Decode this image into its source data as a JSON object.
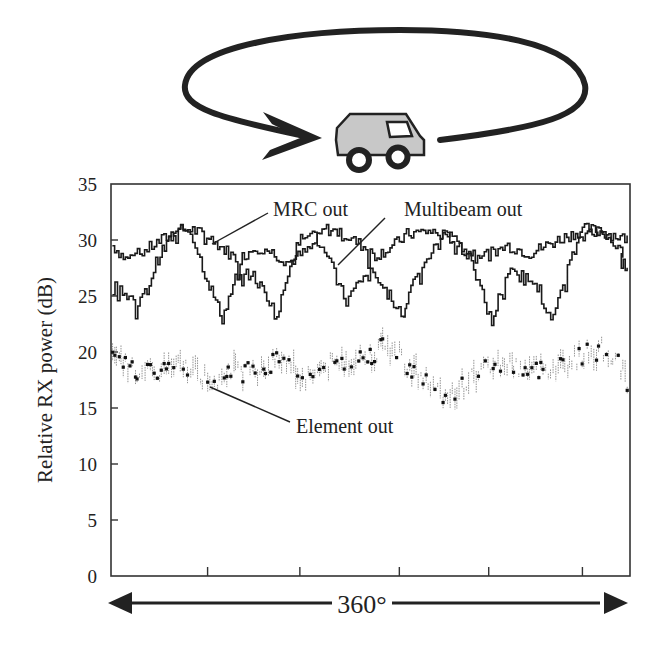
{
  "chart_data": {
    "type": "line",
    "title": "",
    "xlabel": "360°",
    "ylabel": "Relative RX power (dB)",
    "xlim": [
      0,
      360
    ],
    "ylim": [
      0,
      35
    ],
    "yticks": [
      0,
      5,
      10,
      15,
      20,
      25,
      30,
      35
    ],
    "ytick_labels": [
      "0",
      "5",
      "10",
      "15",
      "20",
      "25",
      "30",
      "35"
    ],
    "xticks": [
      67,
      131,
      200,
      262,
      327
    ],
    "xtick_labels": [
      "",
      "",
      "",
      "",
      ""
    ],
    "grid": false,
    "legend": "inline annotations",
    "illustration": "car-circling-arrow",
    "series": [
      {
        "name": "MRC out",
        "style": "staircase-solid",
        "x": [
          1,
          10,
          20,
          30,
          45,
          55,
          68,
          80,
          88,
          100,
          110,
          123,
          138,
          148,
          160,
          175,
          183,
          195,
          205,
          220,
          235,
          245,
          262,
          275,
          290,
          300,
          313,
          330,
          350,
          358
        ],
        "y": [
          29.5,
          28.3,
          28.8,
          29.6,
          30.8,
          31.0,
          30.2,
          29.0,
          28.2,
          29.4,
          29.0,
          28.0,
          29.2,
          31.0,
          30.6,
          29.4,
          28.6,
          29.4,
          30.5,
          30.8,
          30.2,
          29.0,
          28.7,
          29.5,
          28.8,
          29.4,
          30.2,
          31.0,
          30.4,
          30.0
        ]
      },
      {
        "name": "Multibeam out",
        "style": "staircase-solid",
        "x": [
          1,
          8,
          17,
          25,
          31,
          40,
          50,
          55,
          65,
          77,
          86,
          97,
          108,
          115,
          124,
          133,
          138,
          153,
          163,
          170,
          180,
          187,
          196,
          203,
          205,
          211,
          235,
          250,
          259,
          264,
          270,
          277,
          294,
          305,
          315,
          323,
          332,
          345,
          355,
          354,
          358
        ],
        "y": [
          26.8,
          25.5,
          24.0,
          25.5,
          28.0,
          30.0,
          31.0,
          30.8,
          27.0,
          23.0,
          26.5,
          27.0,
          25.0,
          23.0,
          28.0,
          30.5,
          31.0,
          27.5,
          24.5,
          25.8,
          27.0,
          26.0,
          24.5,
          23.0,
          24.8,
          27.0,
          31.0,
          28.0,
          24.5,
          22.5,
          25.5,
          27.0,
          26.5,
          22.5,
          27.0,
          29.5,
          31.0,
          30.5,
          28.5,
          28.0,
          27.5
        ]
      },
      {
        "name": "Element out",
        "style": "noisy-dotted",
        "x": [
          1,
          10,
          20,
          27,
          40,
          55,
          62,
          72,
          80,
          90,
          100,
          112,
          120,
          133,
          140,
          152,
          165,
          178,
          190,
          200,
          207,
          215,
          225,
          235,
          245,
          255,
          265,
          278,
          292,
          300,
          310,
          320,
          330,
          340,
          350,
          355,
          358
        ],
        "y": [
          19.3,
          18.8,
          18.2,
          18.0,
          18.6,
          18.8,
          17.8,
          17.5,
          18.6,
          18.2,
          18.4,
          19.0,
          19.6,
          17.6,
          18.2,
          18.8,
          19.2,
          19.6,
          20.5,
          19.8,
          18.6,
          17.8,
          16.5,
          16.2,
          17.0,
          18.2,
          19.0,
          18.8,
          18.2,
          18.5,
          18.8,
          19.2,
          19.8,
          20.2,
          19.4,
          18.5,
          17.0
        ]
      }
    ],
    "annotations": [
      {
        "text": "MRC out",
        "series": "MRC out"
      },
      {
        "text": "Multibeam out",
        "series": "Multibeam out"
      },
      {
        "text": "Element out",
        "series": "Element out"
      }
    ],
    "span_label": "360°"
  }
}
